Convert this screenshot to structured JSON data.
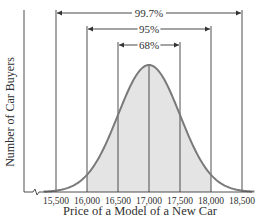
{
  "chart_data": {
    "type": "area",
    "title": "",
    "xlabel": "Price of a Model of a New Car",
    "ylabel": "Number of Car Buyers",
    "x_ticks": [
      "15,500",
      "16,000",
      "16,500",
      "17,000",
      "17,500",
      "18,000",
      "18,500"
    ],
    "x_tick_values": [
      15500,
      16000,
      16500,
      17000,
      17500,
      18000,
      18500
    ],
    "mean": 17000,
    "std_dev": 500,
    "distribution": "normal",
    "intervals": [
      {
        "label": "68%",
        "from": 16500,
        "to": 17500
      },
      {
        "label": "95%",
        "from": 16000,
        "to": 18000
      },
      {
        "label": "99.7%",
        "from": 15500,
        "to": 18500
      }
    ],
    "shaded_region": [
      16000,
      18000
    ],
    "axis_break": true,
    "grid": false,
    "legend": null
  },
  "colors": {
    "curve": "#7a7a7a",
    "fill": "#e4e4e4",
    "lines": "#333333"
  }
}
